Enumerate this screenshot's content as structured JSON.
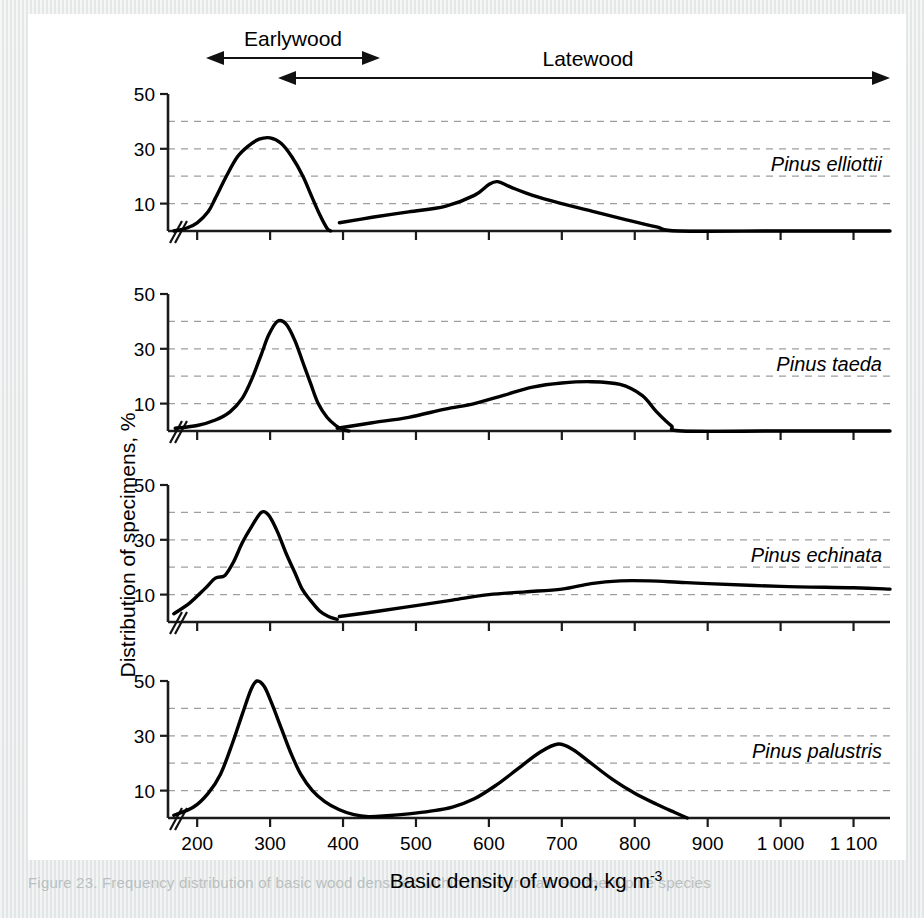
{
  "figure": {
    "band_labels": [
      {
        "name": "earlywood",
        "text": "Earlywood"
      },
      {
        "name": "latewood",
        "text": "Latewood"
      }
    ],
    "y_axis_title": "Distribution of specimens, %",
    "x_axis_title_main": "Basic density of wood, kg m",
    "x_axis_title_exponent": "-3",
    "caption": "Figure 23. Frequency distribution of basic wood densities within the four main southern pine species"
  },
  "chart_data": {
    "type": "line",
    "title": "",
    "xlabel": "Basic density of wood, kg m-3",
    "ylabel": "Distribution of specimens, %",
    "xlim": [
      160,
      1150
    ],
    "ylim": [
      0,
      52
    ],
    "x_ticks": [
      200,
      300,
      400,
      500,
      600,
      700,
      800,
      900,
      1000,
      1100
    ],
    "x_tick_labels": [
      "200",
      "300",
      "400",
      "500",
      "600",
      "700",
      "800",
      "900",
      "1 000",
      "1 100"
    ],
    "y_ticks": [
      10,
      30,
      50
    ],
    "y_tick_labels": [
      "10",
      "30",
      "50"
    ],
    "y_gridlines": [
      10,
      20,
      30,
      40
    ],
    "grid": true,
    "legend": "none",
    "axis_break_at_origin": true,
    "panels": [
      {
        "name": "pinus-elliottii",
        "species": "Pinus elliottii",
        "series": [
          {
            "name": "Earlywood",
            "points": [
              [
                168,
                0
              ],
              [
                185,
                1
              ],
              [
                200,
                3
              ],
              [
                215,
                7
              ],
              [
                225,
                12
              ],
              [
                240,
                20
              ],
              [
                255,
                27
              ],
              [
                270,
                31
              ],
              [
                285,
                33.5
              ],
              [
                300,
                34
              ],
              [
                315,
                32
              ],
              [
                330,
                27
              ],
              [
                345,
                20
              ],
              [
                358,
                12
              ],
              [
                368,
                6
              ],
              [
                378,
                1
              ],
              [
                383,
                0
              ]
            ]
          },
          {
            "name": "Latewood",
            "points": [
              [
                395,
                3
              ],
              [
                440,
                5
              ],
              [
                490,
                7
              ],
              [
                540,
                9
              ],
              [
                580,
                13
              ],
              [
                600,
                17
              ],
              [
                612,
                18
              ],
              [
                630,
                16
              ],
              [
                660,
                13
              ],
              [
                700,
                10
              ],
              [
                745,
                7
              ],
              [
                790,
                4
              ],
              [
                830,
                1.5
              ],
              [
                860,
                0
              ],
              [
                1000,
                0
              ],
              [
                1150,
                0
              ]
            ]
          }
        ]
      },
      {
        "name": "pinus-taeda",
        "species": "Pinus taeda",
        "series": [
          {
            "name": "Earlywood",
            "points": [
              [
                170,
                1
              ],
              [
                200,
                2
              ],
              [
                225,
                4
              ],
              [
                245,
                7
              ],
              [
                262,
                12
              ],
              [
                275,
                19
              ],
              [
                288,
                28
              ],
              [
                298,
                35
              ],
              [
                310,
                40
              ],
              [
                322,
                39
              ],
              [
                334,
                33
              ],
              [
                345,
                25
              ],
              [
                356,
                17
              ],
              [
                366,
                10
              ],
              [
                378,
                5
              ],
              [
                390,
                2
              ],
              [
                400,
                0.5
              ],
              [
                408,
                0
              ]
            ]
          },
          {
            "name": "Latewood",
            "points": [
              [
                392,
                1
              ],
              [
                440,
                3
              ],
              [
                490,
                5
              ],
              [
                540,
                8
              ],
              [
                580,
                10
              ],
              [
                620,
                13
              ],
              [
                660,
                16
              ],
              [
                700,
                17.5
              ],
              [
                740,
                18
              ],
              [
                780,
                17
              ],
              [
                810,
                13
              ],
              [
                830,
                7
              ],
              [
                850,
                2
              ],
              [
                865,
                0
              ],
              [
                1000,
                0
              ],
              [
                1150,
                0
              ]
            ]
          }
        ]
      },
      {
        "name": "pinus-echinata",
        "species": "Pinus echinata",
        "series": [
          {
            "name": "Earlywood",
            "points": [
              [
                168,
                3
              ],
              [
                190,
                7
              ],
              [
                210,
                12
              ],
              [
                225,
                16
              ],
              [
                238,
                17
              ],
              [
                250,
                22
              ],
              [
                262,
                29
              ],
              [
                275,
                35
              ],
              [
                288,
                40
              ],
              [
                298,
                39
              ],
              [
                310,
                33
              ],
              [
                322,
                25
              ],
              [
                334,
                18
              ],
              [
                344,
                12
              ],
              [
                355,
                8
              ],
              [
                368,
                4
              ],
              [
                380,
                2
              ],
              [
                392,
                1
              ]
            ]
          },
          {
            "name": "Latewood",
            "points": [
              [
                395,
                2
              ],
              [
                450,
                4
              ],
              [
                500,
                6
              ],
              [
                550,
                8
              ],
              [
                600,
                10
              ],
              [
                650,
                11
              ],
              [
                700,
                12
              ],
              [
                740,
                14
              ],
              [
                780,
                15
              ],
              [
                820,
                15
              ],
              [
                860,
                14.5
              ],
              [
                900,
                14
              ],
              [
                1000,
                13
              ],
              [
                1100,
                12.5
              ],
              [
                1150,
                12
              ]
            ]
          }
        ]
      },
      {
        "name": "pinus-palustris",
        "species": "Pinus palustris",
        "series": [
          {
            "name": "Combined",
            "points": [
              [
                168,
                1
              ],
              [
                195,
                4
              ],
              [
                215,
                9
              ],
              [
                232,
                16
              ],
              [
                248,
                27
              ],
              [
                262,
                38
              ],
              [
                274,
                47
              ],
              [
                282,
                50
              ],
              [
                292,
                48
              ],
              [
                302,
                42
              ],
              [
                315,
                33
              ],
              [
                328,
                24
              ],
              [
                342,
                16
              ],
              [
                358,
                10
              ],
              [
                375,
                6
              ],
              [
                395,
                3
              ],
              [
                415,
                1.2
              ],
              [
                435,
                0.5
              ],
              [
                460,
                0.8
              ],
              [
                490,
                1.5
              ],
              [
                520,
                2.5
              ],
              [
                550,
                4
              ],
              [
                580,
                7
              ],
              [
                610,
                12
              ],
              [
                640,
                18
              ],
              [
                670,
                24
              ],
              [
                695,
                27
              ],
              [
                715,
                25
              ],
              [
                740,
                20
              ],
              [
                770,
                14
              ],
              [
                800,
                9
              ],
              [
                830,
                5
              ],
              [
                855,
                2
              ],
              [
                872,
                0
              ]
            ]
          }
        ]
      }
    ]
  }
}
